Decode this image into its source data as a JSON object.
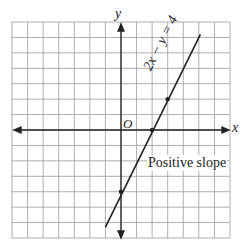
{
  "chart_data": {
    "type": "line",
    "title": "",
    "equation": "2x − y = 4",
    "annotation": "Positive slope",
    "xlabel": "x",
    "ylabel": "y",
    "origin_label": "O",
    "xlim": [
      -7,
      7
    ],
    "ylim": [
      -7,
      7
    ],
    "grid": true,
    "points": [
      [
        0,
        -4
      ],
      [
        2,
        0
      ],
      [
        3,
        2
      ]
    ],
    "line_endpoints": [
      [
        -1,
        -6.3
      ],
      [
        5.1,
        6.2
      ]
    ]
  },
  "labels": {
    "x_axis": "x",
    "y_axis": "y",
    "origin": "O",
    "equation": "2x − y = 4",
    "slope_note": "Positive slope"
  }
}
